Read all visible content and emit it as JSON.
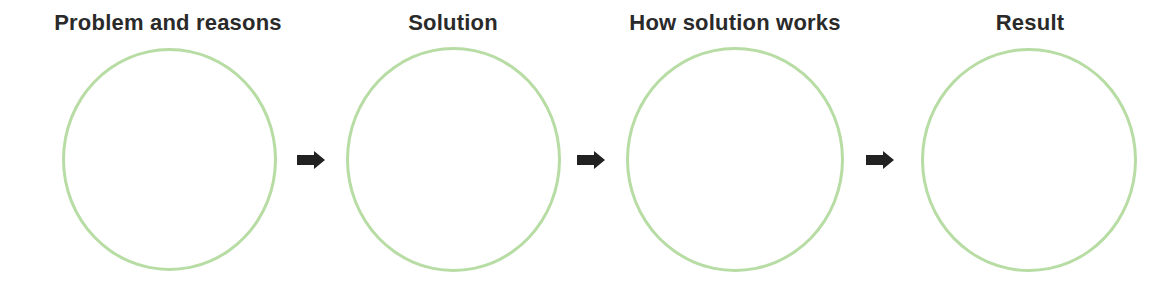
{
  "diagram": {
    "type": "process-flow",
    "colors": {
      "circle_stroke": "#b7dca4",
      "arrow_fill": "#222222",
      "title_text": "#2a2a2a",
      "background": "#ffffff"
    },
    "stages": [
      {
        "title": "Problem and reasons",
        "content": ""
      },
      {
        "title": "Solution",
        "content": ""
      },
      {
        "title": "How solution works",
        "content": ""
      },
      {
        "title": "Result",
        "content": ""
      }
    ],
    "connectors": [
      {
        "from": 0,
        "to": 1,
        "icon": "right-arrow-icon"
      },
      {
        "from": 1,
        "to": 2,
        "icon": "right-arrow-icon"
      },
      {
        "from": 2,
        "to": 3,
        "icon": "right-arrow-icon"
      }
    ]
  }
}
